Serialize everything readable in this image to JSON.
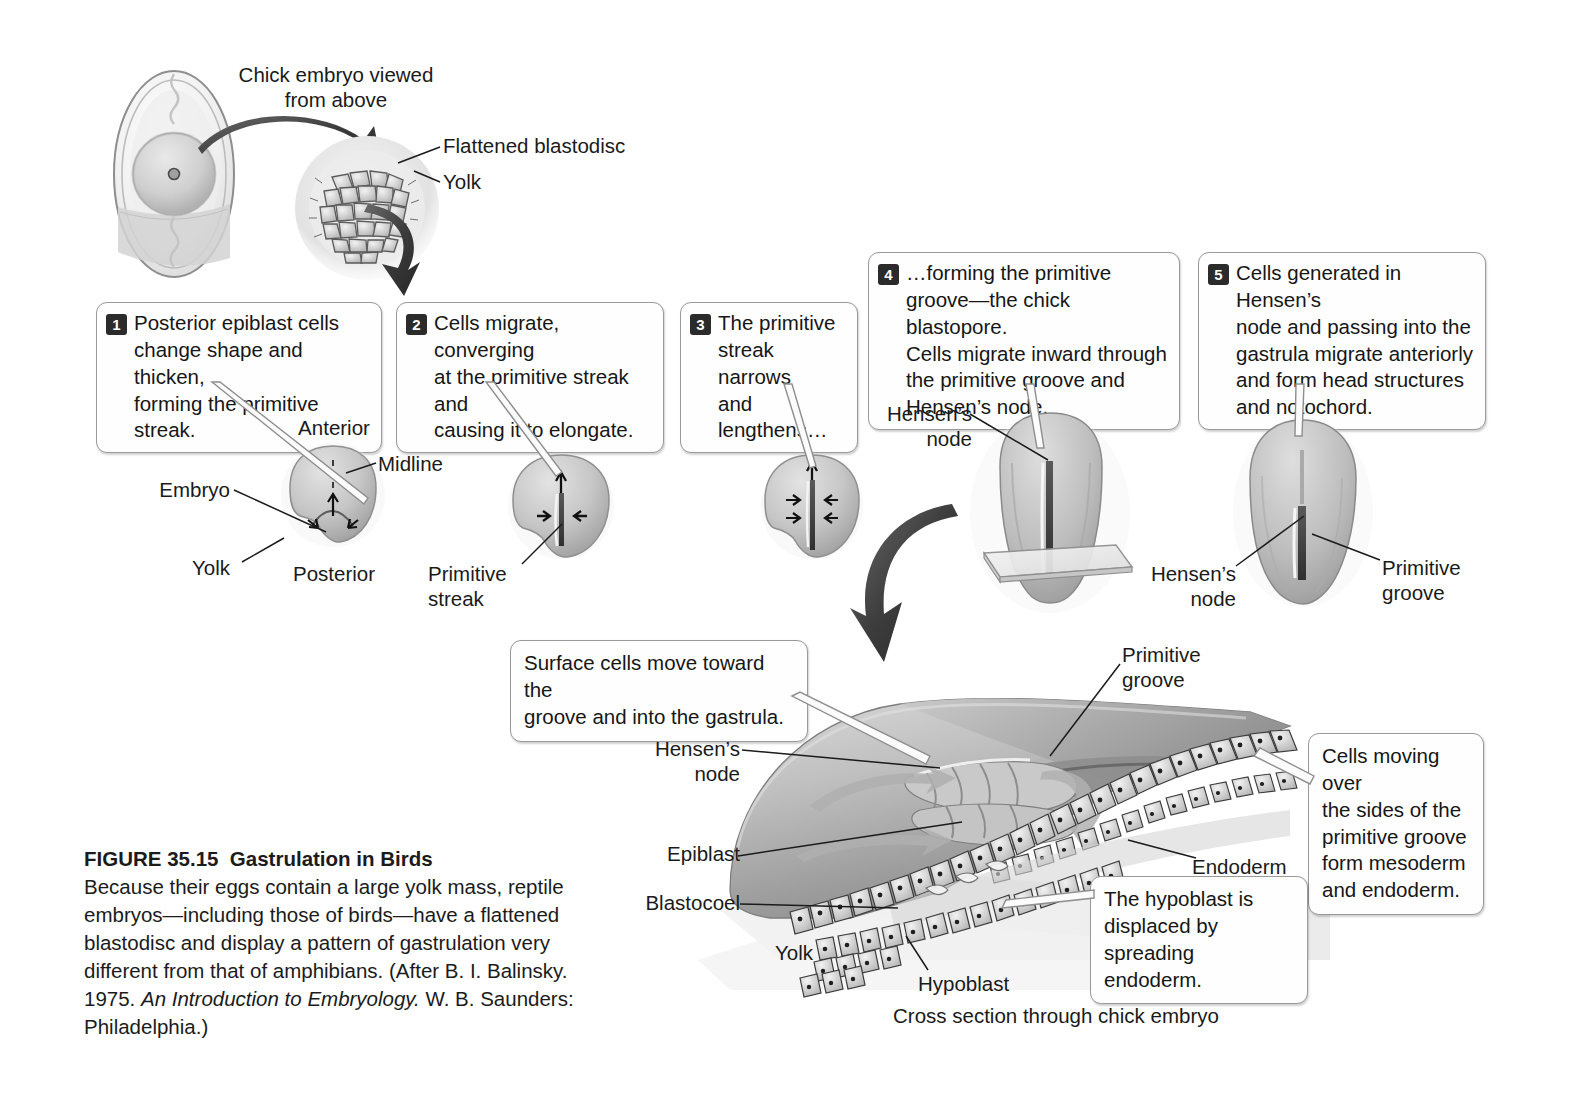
{
  "figure": {
    "number": "FIGURE 35.15",
    "title": "Gastrulation in Birds",
    "caption_part1": "Because their eggs contain a large yolk mass, reptile embryos—including those of birds—have a flattened blastodisc and display a pattern of gastrulation very different from that of amphibians. (After B. I. Balinsky. 1975. ",
    "caption_italic": "An Introduction to Embryology.",
    "caption_part2": " W. B. Saunders: Philadelphia.)"
  },
  "top": {
    "chick_view_label": "Chick embryo viewed\nfrom above",
    "flattened_blastodisc_label": "Flattened blastodisc",
    "yolk_label": "Yolk"
  },
  "steps": [
    {
      "num": "1",
      "text": "Posterior epiblast cells\nchange shape and thicken,\nforming the primitive streak."
    },
    {
      "num": "2",
      "text": "Cells migrate, converging\nat the primitive streak and\ncausing it to elongate."
    },
    {
      "num": "3",
      "text": "The primitive\nstreak narrows\nand lengthens…"
    },
    {
      "num": "4",
      "text": "…forming the primitive\ngroove—the chick blastopore.\nCells migrate inward through\nthe primitive groove and\nHensen’s node."
    },
    {
      "num": "5",
      "text": "Cells generated in Hensen’s\nnode and passing into the\ngastrula migrate anteriorly\nand form head structures\nand notochord."
    }
  ],
  "stage1_labels": {
    "anterior": "Anterior",
    "midline": "Midline",
    "embryo": "Embryo",
    "yolk": "Yolk",
    "posterior": "Posterior"
  },
  "stage2_labels": {
    "primitive_streak": "Primitive\nstreak"
  },
  "stage4_labels": {
    "hensens_node": "Hensen’s\nnode"
  },
  "stage5_labels": {
    "hensens_node": "Hensen’s\nnode",
    "primitive_groove": "Primitive\ngroove"
  },
  "cross_section": {
    "surface_cells_callout": "Surface cells move toward the\ngroove and into the gastrula.",
    "mesoderm_callout": "Cells moving over\nthe sides of the\nprimitive groove\nform mesoderm\nand endoderm.",
    "hypoblast_callout": "The hypoblast is\ndisplaced by\nspreading endoderm.",
    "primitive_groove": "Primitive\ngroove",
    "hensens_node": "Hensen’s\nnode",
    "epiblast": "Epiblast",
    "blastocoel": "Blastocoel",
    "endoderm": "Endoderm",
    "yolk": "Yolk",
    "hypoblast": "Hypoblast",
    "bottom_caption": "Cross section through chick embryo"
  },
  "colors": {
    "ink": "#1a1a1a",
    "bubble_border": "#9a9a9a",
    "badge_bg": "#2b2b2b",
    "tissue_mid": "#b9b9b9",
    "tissue_dark": "#7c7c7c",
    "tissue_light": "#dcdcdc",
    "arrow_dark": "#3a3a3a"
  }
}
